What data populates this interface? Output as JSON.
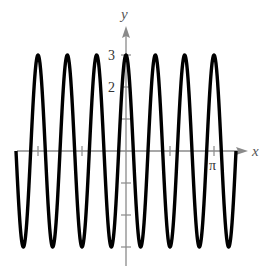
{
  "chart_data": {
    "type": "line",
    "title": "",
    "function": "y = 3cos(6x)",
    "xlabel": "x",
    "ylabel": "y",
    "xlim": [
      -3.927,
      3.927
    ],
    "ylim": [
      -3,
      3
    ],
    "x_ticks": [
      {
        "value": -3.1416,
        "label": ""
      },
      {
        "value": -1.5708,
        "label": ""
      },
      {
        "value": 1.5708,
        "label": ""
      },
      {
        "value": 3.1416,
        "label": "π"
      }
    ],
    "y_ticks": [
      {
        "value": 3,
        "label": "3"
      },
      {
        "value": 2,
        "label": "2"
      },
      {
        "value": 1,
        "label": ""
      },
      {
        "value": -1,
        "label": ""
      },
      {
        "value": -2,
        "label": ""
      },
      {
        "value": -3,
        "label": ""
      }
    ],
    "amplitude": 3,
    "angular_frequency": 6,
    "period": 1.0472,
    "grid": false,
    "legend": null,
    "series": [
      {
        "name": "3cos(6x)",
        "color": "#000000",
        "x_range": [
          -3.927,
          3.927
        ]
      }
    ]
  },
  "labels": {
    "x_axis": "x",
    "y_axis": "y",
    "pi_tick": "π",
    "y_tick_3": "3",
    "y_tick_2": "2"
  },
  "colors": {
    "curve": "#000000",
    "axis": "#8a8a8a"
  }
}
